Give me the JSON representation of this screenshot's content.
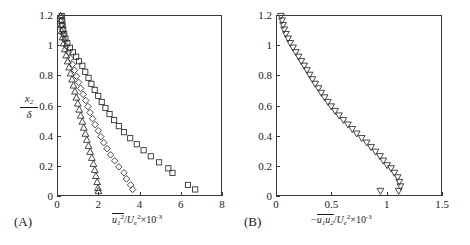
{
  "figure": {
    "panels": [
      {
        "tag": "(A)",
        "tag_name": "panel-a",
        "x_axis": {
          "label_parts": {
            "overline": "u",
            "overline_sub": "1",
            "overline_sup": "2",
            "denom": "U",
            "denom_sub": "e",
            "denom_sup": "2",
            "factor": "×10",
            "factor_exp": "-3"
          },
          "ticks": [
            "0",
            "2",
            "4",
            "6",
            "8"
          ],
          "tick_values": [
            0,
            2,
            4,
            6,
            8
          ],
          "min": 0,
          "max": 8
        },
        "y_axis": {
          "numerator": "x",
          "numerator_sub": "2",
          "denominator": "δ",
          "ticks": [
            "0",
            "0.2",
            "0.4",
            "0.6",
            "0.8",
            "1",
            "1.2"
          ],
          "tick_values": [
            0,
            0.2,
            0.4,
            0.6,
            0.8,
            1,
            1.2
          ],
          "min": 0,
          "max": 1.2
        }
      },
      {
        "tag": "(B)",
        "tag_name": "panel-b",
        "x_axis": {
          "label_parts": {
            "minus": "−",
            "overline": "u",
            "overline_sub1": "1",
            "overline2": "u",
            "overline_sub2": "2",
            "denom": "U",
            "denom_sub": "e",
            "denom_sup": "2",
            "factor": "×10",
            "factor_exp": "-3"
          },
          "ticks": [
            "0",
            "0.5",
            "1",
            "1.5"
          ],
          "tick_values": [
            0,
            0.5,
            1,
            1.5
          ],
          "min": 0,
          "max": 1.5
        },
        "y_axis": {
          "ticks": [
            "0",
            "0.2",
            "0.4",
            "0.6",
            "0.8",
            "1",
            "1.2"
          ],
          "tick_values": [
            0,
            0.2,
            0.4,
            0.6,
            0.8,
            1,
            1.2
          ],
          "min": 0,
          "max": 1.2
        }
      }
    ]
  },
  "chart_data": [
    {
      "type": "scatter",
      "panel": "(A)",
      "title": "",
      "xlabel": "u1^2/Ue^2 x10^-3",
      "ylabel": "x2/delta",
      "xlim": [
        0,
        8
      ],
      "ylim": [
        0,
        1.2
      ],
      "grid": false,
      "legend": "none",
      "series": [
        {
          "name": "squares",
          "marker": "square",
          "color": "#333333",
          "points": [
            [
              0.18,
              1.2
            ],
            [
              0.2,
              1.17
            ],
            [
              0.22,
              1.14
            ],
            [
              0.25,
              1.11
            ],
            [
              0.3,
              1.08
            ],
            [
              0.36,
              1.05
            ],
            [
              0.45,
              1.02
            ],
            [
              0.58,
              0.99
            ],
            [
              0.72,
              0.96
            ],
            [
              0.88,
              0.93
            ],
            [
              1.02,
              0.9
            ],
            [
              1.18,
              0.87
            ],
            [
              1.32,
              0.83
            ],
            [
              1.48,
              0.79
            ],
            [
              1.62,
              0.75
            ],
            [
              1.78,
              0.71
            ],
            [
              1.95,
              0.67
            ],
            [
              2.12,
              0.63
            ],
            [
              2.3,
              0.59
            ],
            [
              2.5,
              0.55
            ],
            [
              2.72,
              0.51
            ],
            [
              2.95,
              0.47
            ],
            [
              3.2,
              0.43
            ],
            [
              3.5,
              0.39
            ],
            [
              3.82,
              0.35
            ],
            [
              4.15,
              0.31
            ],
            [
              4.5,
              0.27
            ],
            [
              4.9,
              0.23
            ],
            [
              5.35,
              0.19
            ],
            [
              5.55,
              0.16
            ],
            [
              6.3,
              0.08
            ],
            [
              6.65,
              0.05
            ]
          ]
        },
        {
          "name": "diamonds",
          "marker": "diamond",
          "color": "#333333",
          "points": [
            [
              0.15,
              1.2
            ],
            [
              0.17,
              1.17
            ],
            [
              0.19,
              1.14
            ],
            [
              0.22,
              1.11
            ],
            [
              0.26,
              1.08
            ],
            [
              0.32,
              1.04
            ],
            [
              0.4,
              1.0
            ],
            [
              0.5,
              0.96
            ],
            [
              0.6,
              0.92
            ],
            [
              0.7,
              0.88
            ],
            [
              0.8,
              0.84
            ],
            [
              0.9,
              0.8
            ],
            [
              1.0,
              0.76
            ],
            [
              1.1,
              0.72
            ],
            [
              1.22,
              0.68
            ],
            [
              1.35,
              0.64
            ],
            [
              1.45,
              0.6
            ],
            [
              1.55,
              0.56
            ],
            [
              1.68,
              0.52
            ],
            [
              1.8,
              0.48
            ],
            [
              1.95,
              0.44
            ],
            [
              2.08,
              0.4
            ],
            [
              2.22,
              0.36
            ],
            [
              2.38,
              0.32
            ],
            [
              2.55,
              0.28
            ],
            [
              2.75,
              0.24
            ],
            [
              2.95,
              0.2
            ],
            [
              3.2,
              0.16
            ],
            [
              3.32,
              0.12
            ],
            [
              3.52,
              0.08
            ],
            [
              3.62,
              0.05
            ]
          ]
        },
        {
          "name": "triangles-up",
          "marker": "triangle-up",
          "color": "#333333",
          "points": [
            [
              0.12,
              1.2
            ],
            [
              0.14,
              1.17
            ],
            [
              0.16,
              1.14
            ],
            [
              0.18,
              1.1
            ],
            [
              0.22,
              1.06
            ],
            [
              0.27,
              1.02
            ],
            [
              0.33,
              0.98
            ],
            [
              0.4,
              0.94
            ],
            [
              0.47,
              0.9
            ],
            [
              0.54,
              0.86
            ],
            [
              0.61,
              0.82
            ],
            [
              0.68,
              0.78
            ],
            [
              0.75,
              0.74
            ],
            [
              0.82,
              0.7
            ],
            [
              0.89,
              0.66
            ],
            [
              0.96,
              0.62
            ],
            [
              1.03,
              0.58
            ],
            [
              1.1,
              0.54
            ],
            [
              1.18,
              0.5
            ],
            [
              1.25,
              0.46
            ],
            [
              1.33,
              0.42
            ],
            [
              1.4,
              0.38
            ],
            [
              1.48,
              0.34
            ],
            [
              1.56,
              0.3
            ],
            [
              1.64,
              0.26
            ],
            [
              1.72,
              0.22
            ],
            [
              1.78,
              0.18
            ],
            [
              1.84,
              0.14
            ],
            [
              1.9,
              0.1
            ],
            [
              1.94,
              0.06
            ],
            [
              1.96,
              0.04
            ]
          ]
        }
      ]
    },
    {
      "type": "scatter",
      "panel": "(B)",
      "title": "",
      "xlabel": "-u1u2/Ue^2 x10^-3",
      "ylabel": "x2/delta",
      "xlim": [
        0,
        1.5
      ],
      "ylim": [
        0,
        1.2
      ],
      "grid": false,
      "legend": "none",
      "series": [
        {
          "name": "triangles-down",
          "marker": "triangle-down",
          "color": "#333333",
          "points": [
            [
              0.035,
              1.2
            ],
            [
              0.045,
              1.17
            ],
            [
              0.055,
              1.14
            ],
            [
              0.065,
              1.11
            ],
            [
              0.08,
              1.08
            ],
            [
              0.1,
              1.05
            ],
            [
              0.12,
              1.02
            ],
            [
              0.145,
              0.99
            ],
            [
              0.17,
              0.96
            ],
            [
              0.195,
              0.93
            ],
            [
              0.22,
              0.9
            ],
            [
              0.245,
              0.87
            ],
            [
              0.27,
              0.84
            ],
            [
              0.295,
              0.81
            ],
            [
              0.32,
              0.78
            ],
            [
              0.345,
              0.75
            ],
            [
              0.375,
              0.72
            ],
            [
              0.4,
              0.69
            ],
            [
              0.43,
              0.66
            ],
            [
              0.46,
              0.63
            ],
            [
              0.49,
              0.6
            ],
            [
              0.525,
              0.57
            ],
            [
              0.56,
              0.54
            ],
            [
              0.6,
              0.51
            ],
            [
              0.64,
              0.48
            ],
            [
              0.68,
              0.45
            ],
            [
              0.72,
              0.42
            ],
            [
              0.765,
              0.39
            ],
            [
              0.81,
              0.36
            ],
            [
              0.85,
              0.33
            ],
            [
              0.89,
              0.3
            ],
            [
              0.93,
              0.27
            ],
            [
              0.96,
              0.24
            ],
            [
              0.995,
              0.21
            ],
            [
              1.03,
              0.19
            ],
            [
              1.06,
              0.16
            ],
            [
              1.09,
              0.13
            ],
            [
              1.105,
              0.1
            ],
            [
              1.115,
              0.07
            ],
            [
              0.935,
              0.04
            ],
            [
              1.1,
              0.04
            ]
          ]
        }
      ]
    }
  ]
}
